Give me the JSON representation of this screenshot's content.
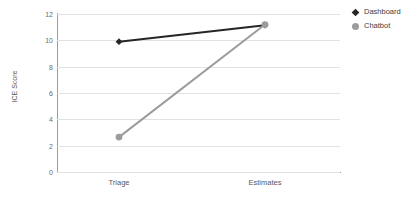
{
  "chart_data": {
    "type": "line",
    "title": "",
    "xlabel": "",
    "ylabel": "ICE Score",
    "categories": [
      "Triage",
      "Estimates"
    ],
    "ylim": [
      0,
      12
    ],
    "yticks": [
      0,
      2,
      4,
      6,
      8,
      10,
      12
    ],
    "ytick_labels": [
      "0",
      "2",
      "4",
      "6",
      "8",
      "10",
      "12"
    ],
    "grid": "horizontal",
    "legend_position": "top-right",
    "series": [
      {
        "name": "Dashboard",
        "values": [
          9.9,
          11.15
        ],
        "color": "#262626",
        "marker": "diamond"
      },
      {
        "name": "Chatbot",
        "values": [
          2.65,
          11.2
        ],
        "color": "#9c9c9c",
        "marker": "circle"
      }
    ]
  },
  "legend": {
    "items": [
      {
        "label": "Dashboard",
        "marker_icon": "diamond-marker-icon",
        "color": "#262626"
      },
      {
        "label": "Chatbot",
        "marker_icon": "circle-marker-icon",
        "color": "#9c9c9c"
      }
    ]
  },
  "axes": {
    "y_title": "ICE Score",
    "y_tick_labels": [
      "12",
      "10",
      "8",
      "6",
      "4",
      "2",
      "0"
    ],
    "x_tick_labels": [
      "Triage",
      "Estimates"
    ]
  },
  "colors": {
    "axis": "#9c9c9c",
    "gridline": "#e2e2e2",
    "text": "#595959",
    "series_dashboard": "#262626",
    "series_chatbot": "#9c9c9c",
    "background": "#ffffff"
  }
}
